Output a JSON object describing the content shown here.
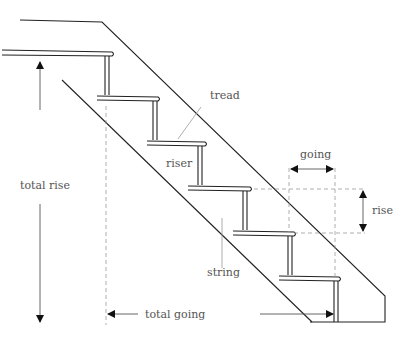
{
  "diagram": {
    "labels": {
      "tread": "tread",
      "riser": "riser",
      "going": "going",
      "rise": "rise",
      "string": "string",
      "total_rise": "total rise",
      "total_going": "total going"
    },
    "colors": {
      "line": "#222222",
      "dimension": "#888888",
      "text": "#555555"
    },
    "step_count": 6
  }
}
